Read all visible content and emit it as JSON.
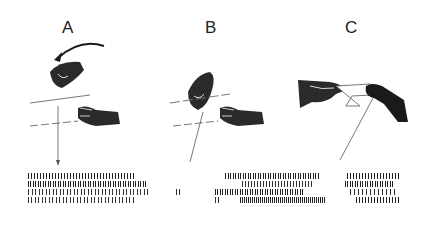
{
  "figure": {
    "panels": [
      {
        "label": "A",
        "scene": "experimenter hand rotating overhead (curved arrow) above monkey hand reaching below a horizontal plane; vertical recording line with arrow down to raster",
        "raster_rows": 4
      },
      {
        "label": "B",
        "scene": "experimenter hand holding object near plane, monkey hand reaching below; oblique line to raster",
        "raster_rows": 4
      },
      {
        "label": "C",
        "scene": "two hands exchanging object across plane; oblique line to raster",
        "raster_rows": 4
      }
    ],
    "colors": {
      "ink": "#1a1a1a",
      "line": "#555555",
      "background": "#ffffff"
    }
  }
}
